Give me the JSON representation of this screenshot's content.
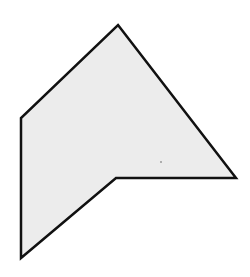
{
  "diagram": {
    "type": "polygon",
    "shape_name": "concave-hexagon",
    "vertex_count": 6,
    "vertices": [
      {
        "x": 118,
        "y": 25
      },
      {
        "x": 236,
        "y": 178
      },
      {
        "x": 116,
        "y": 178
      },
      {
        "x": 21,
        "y": 258
      },
      {
        "x": 21,
        "y": 118
      }
    ],
    "points": "118,25 236,178 116,178 21,258 21,118",
    "colors": {
      "fill": "#ececec",
      "stroke": "#111111",
      "background": "#ffffff"
    },
    "stroke_width": 2.5
  }
}
